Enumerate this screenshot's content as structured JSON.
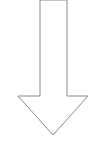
{
  "diagram": {
    "shape": "down-arrow",
    "fill_color": "#ffffff",
    "stroke_color": "#8a8a8a",
    "stroke_width": 1,
    "points": "40,0 67,0 67,96 88,96 53,135 18,96 40,96 40,0"
  }
}
